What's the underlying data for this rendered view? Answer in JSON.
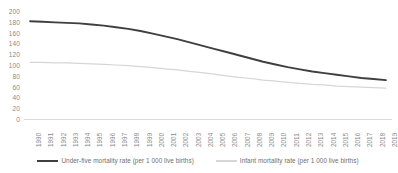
{
  "chart_data": {
    "type": "line",
    "title": "",
    "subtitle": "",
    "xlabel": "",
    "ylabel": "",
    "ylim": [
      0,
      200
    ],
    "ytick_step": 20,
    "yticks": [
      200,
      180,
      160,
      140,
      120,
      100,
      80,
      60,
      40,
      20,
      0
    ],
    "grid": false,
    "legend_position": "bottom",
    "x": [
      "1990",
      "1991",
      "1992",
      "1993",
      "1994",
      "1995",
      "1996",
      "1997",
      "1998",
      "1999",
      "2000",
      "2001",
      "2002",
      "2003",
      "2004",
      "2005",
      "2006",
      "2007",
      "2008",
      "2009",
      "2010",
      "2011",
      "2012",
      "2013",
      "2014",
      "2015",
      "2016",
      "2017",
      "2018",
      "2019"
    ],
    "categories": [
      "1990",
      "1991",
      "1992",
      "1993",
      "1994",
      "1995",
      "1996",
      "1997",
      "1998",
      "1999",
      "2000",
      "2001",
      "2002",
      "2003",
      "2004",
      "2005",
      "2006",
      "2007",
      "2008",
      "2009",
      "2010",
      "2011",
      "2012",
      "2013",
      "2014",
      "2015",
      "2016",
      "2017",
      "2018",
      "2019"
    ],
    "series": [
      {
        "name": "Under-five mortality rate (per 1 000 live births)",
        "color": "#3f3f3f",
        "values": [
          181,
          180,
          179,
          178,
          177,
          175,
          173,
          170,
          167,
          163,
          158,
          153,
          148,
          142,
          136,
          130,
          124,
          118,
          112,
          106,
          101,
          96,
          92,
          88,
          85,
          82,
          79,
          76,
          74,
          72
        ]
      },
      {
        "name": "Infant mortality rate (per 1 000 live births)",
        "color": "#d6d6d6",
        "values": [
          105,
          105,
          104,
          104,
          103,
          102,
          101,
          100,
          99,
          97,
          95,
          93,
          91,
          88,
          86,
          83,
          80,
          77,
          75,
          72,
          70,
          68,
          66,
          64,
          63,
          61,
          60,
          59,
          58,
          57
        ]
      }
    ]
  },
  "legend": {
    "items": [
      {
        "label": "Under-five mortality rate (per 1 000 live births)",
        "color": "#3f3f3f",
        "icon": "line-swatch-icon"
      },
      {
        "label": "Infant mortality rate (per 1 000 live births)",
        "color": "#d6d6d6",
        "icon": "line-swatch-icon"
      }
    ]
  },
  "colors": {
    "under_five": "#3f3f3f",
    "infant": "#d6d6d6",
    "axis_text": "#8a8a8a",
    "baseline": "#d9d9d9",
    "background": "#ffffff"
  }
}
